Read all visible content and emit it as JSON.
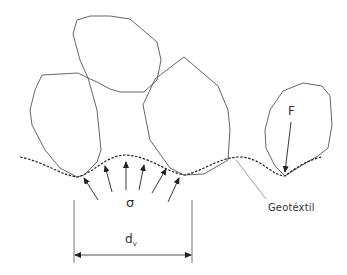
{
  "diagram": {
    "title": "",
    "labels": {
      "stress": "σ",
      "force": "F",
      "diameter_main": "d",
      "diameter_sub": "v",
      "geotextile": "Geotéxtil"
    },
    "colors": {
      "stroke": "#555555",
      "text": "#333333",
      "background": "#ffffff"
    },
    "stones": [
      {
        "name": "left-stone",
        "points": "42,75 78,73 88,78 97,110 101,150 97,162 84,175 77,177 60,168 45,150 32,125 30,110 35,90"
      },
      {
        "name": "top-stone",
        "points": "77,20 90,16 110,16 130,19 157,42 161,60 157,80 144,92 120,92 110,89 97,82 88,78 80,60 73,34"
      },
      {
        "name": "right-stone",
        "points": "184,57 218,86 228,110 230,130 228,160 204,174 184,175 170,168 150,140 143,105 155,79"
      },
      {
        "name": "small-stone",
        "points": "303,83 322,86 330,96 332,125 328,148 318,156 304,164 285,176 275,166 266,148 265,130 270,110 283,91"
      }
    ]
  }
}
